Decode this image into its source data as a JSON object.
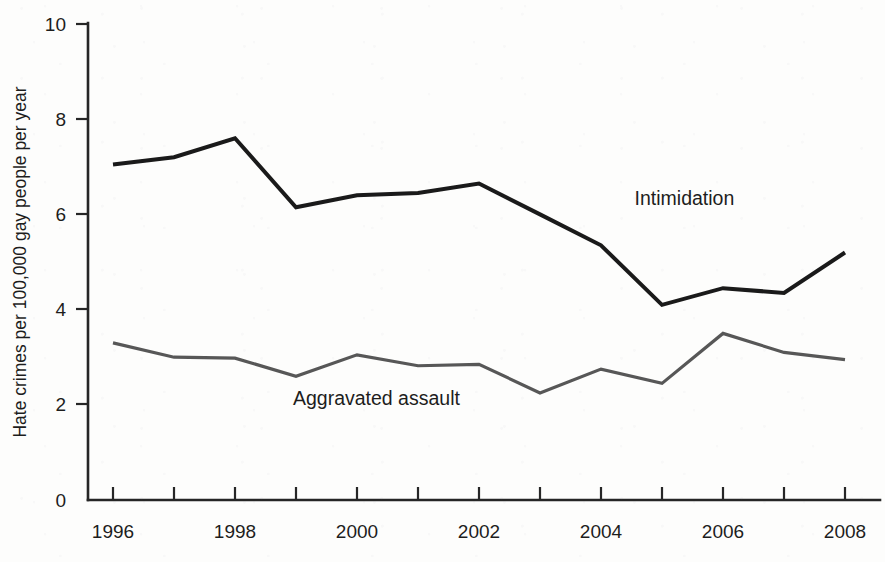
{
  "chart_data": {
    "type": "line",
    "title": "",
    "subtitle": "",
    "xlabel": "",
    "ylabel": "Hate crimes per 100,000 gay people per year",
    "x": [
      1996,
      1997,
      1998,
      1999,
      2000,
      2001,
      2002,
      2003,
      2004,
      2005,
      2006,
      2007,
      2008
    ],
    "xlim": [
      1996,
      2008
    ],
    "ylim": [
      0,
      10
    ],
    "yticks": [
      0,
      2,
      4,
      6,
      8,
      10
    ],
    "ytick_labels": [
      "0",
      "2",
      "4",
      "6",
      "8",
      "10"
    ],
    "xticks": [
      1996,
      1997,
      1998,
      1999,
      2000,
      2001,
      2002,
      2003,
      2004,
      2005,
      2006,
      2007,
      2008
    ],
    "xtick_labels": [
      "1996",
      "",
      "1998",
      "",
      "2000",
      "",
      "2002",
      "",
      "2004",
      "",
      "2006",
      "",
      "2008"
    ],
    "grid": false,
    "legend_position": "inline-annotation",
    "series": [
      {
        "name": "Intimidation",
        "color": "#1a1a1a",
        "stroke_width": 4.0,
        "label_x": 2004.55,
        "label_y": 6.2,
        "values": [
          7.05,
          7.2,
          7.6,
          6.15,
          6.4,
          6.45,
          6.65,
          6.0,
          5.35,
          4.1,
          4.45,
          4.35,
          5.2
        ]
      },
      {
        "name": "Aggravated assault",
        "color": "#575757",
        "stroke_width": 3.2,
        "label_x": 1998.95,
        "label_y": 2.0,
        "values": [
          3.3,
          3.0,
          2.98,
          2.6,
          3.05,
          2.82,
          2.85,
          2.25,
          2.75,
          2.45,
          3.5,
          3.1,
          2.95
        ]
      }
    ]
  },
  "axes": {
    "y_axis_title": "Hate crimes per 100,000 gay people per year",
    "y_tick_0": "0",
    "y_tick_1": "2",
    "y_tick_2": "4",
    "y_tick_3": "6",
    "y_tick_4": "8",
    "y_tick_5": "10",
    "x_tick_0": "1996",
    "x_tick_1": "1998",
    "x_tick_2": "2000",
    "x_tick_3": "2002",
    "x_tick_4": "2004",
    "x_tick_5": "2006",
    "x_tick_6": "2008"
  },
  "annotations": {
    "series_1_label": "Intimidation",
    "series_2_label": "Aggravated assault"
  }
}
